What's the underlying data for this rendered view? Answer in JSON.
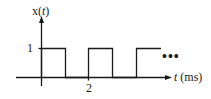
{
  "diagram": {
    "type": "periodic-square-wave",
    "y_axis_label_prefix": "x(",
    "y_axis_label_var": "t",
    "y_axis_label_suffix": ")",
    "x_axis_label_var": "t",
    "x_axis_label_unit": " (ms)",
    "y_tick_label": "1",
    "x_tick_label": "2",
    "continuation": "•••",
    "period_ms": 2,
    "duty_cycle": 0.5,
    "high_value": 1,
    "low_value": 0,
    "pulses_shown": 3,
    "line_color": "#1a1a1a"
  }
}
